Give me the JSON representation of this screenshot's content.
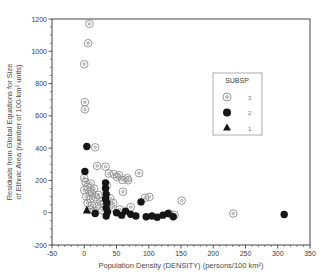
{
  "chart_data": {
    "type": "scatter",
    "title": "",
    "xlabel": "Population Density (DENSITY) (persons/100 km²)",
    "ylabel_line1": "Residuals from Global Equations for Size",
    "ylabel_line2": "of Ethnic Area (number of 100-km² units)",
    "xlim": [
      -50,
      350
    ],
    "ylim": [
      -200,
      1200
    ],
    "x_ticks": [
      -50,
      0,
      50,
      100,
      150,
      200,
      250,
      300,
      350
    ],
    "y_ticks": [
      -200,
      0,
      200,
      400,
      600,
      800,
      1000,
      1200
    ],
    "x_minor_step": 10,
    "y_minor_step": 50,
    "grid": false,
    "legend": {
      "title": "SUBSP",
      "position": "upper-right",
      "items": [
        {
          "label": "3",
          "marker": "open-double-circle"
        },
        {
          "label": "2",
          "marker": "filled-circle"
        },
        {
          "label": "1",
          "marker": "filled-triangle"
        }
      ]
    },
    "colors": {
      "open_marker": "#8c8c8c",
      "filled_marker": "#161616",
      "frame": "#444444"
    },
    "series": [
      {
        "name": "3",
        "marker": "open-double-circle",
        "points": [
          [
            8,
            1170
          ],
          [
            6,
            1050
          ],
          [
            0,
            920
          ],
          [
            1,
            685
          ],
          [
            1,
            640
          ],
          [
            17,
            405
          ],
          [
            20,
            290
          ],
          [
            33,
            285
          ],
          [
            85,
            245
          ],
          [
            38,
            243
          ],
          [
            46,
            238
          ],
          [
            54,
            232
          ],
          [
            51,
            220
          ],
          [
            67,
            214
          ],
          [
            59,
            203
          ],
          [
            68,
            201
          ],
          [
            0,
            215
          ],
          [
            2,
            190
          ],
          [
            10,
            180
          ],
          [
            35,
            170
          ],
          [
            5,
            160
          ],
          [
            15,
            150
          ],
          [
            0,
            140
          ],
          [
            8,
            130
          ],
          [
            60,
            130
          ],
          [
            12,
            120
          ],
          [
            22,
            110
          ],
          [
            3,
            100
          ],
          [
            18,
            95
          ],
          [
            40,
            90
          ],
          [
            10,
            85
          ],
          [
            25,
            70
          ],
          [
            45,
            60
          ],
          [
            5,
            60
          ],
          [
            30,
            55
          ],
          [
            12,
            45
          ],
          [
            20,
            40
          ],
          [
            42,
            30
          ],
          [
            8,
            20
          ],
          [
            28,
            15
          ],
          [
            15,
            10
          ],
          [
            55,
            20
          ],
          [
            72,
            35
          ],
          [
            94,
            92
          ],
          [
            101,
            98
          ],
          [
            151,
            75
          ],
          [
            140,
            -15
          ],
          [
            132,
            -5
          ],
          [
            231,
            -5
          ]
        ]
      },
      {
        "name": "2",
        "marker": "filled-circle",
        "points": [
          [
            4,
            410
          ],
          [
            1,
            255
          ],
          [
            33,
            185
          ],
          [
            33,
            150
          ],
          [
            34,
            115
          ],
          [
            33,
            85
          ],
          [
            35,
            60
          ],
          [
            34,
            30
          ],
          [
            36,
            5
          ],
          [
            34,
            -20
          ],
          [
            17,
            -5
          ],
          [
            50,
            0
          ],
          [
            58,
            -15
          ],
          [
            64,
            10
          ],
          [
            72,
            -10
          ],
          [
            80,
            -20
          ],
          [
            88,
            67
          ],
          [
            96,
            -25
          ],
          [
            105,
            -20
          ],
          [
            113,
            -28
          ],
          [
            122,
            -15
          ],
          [
            130,
            -5
          ],
          [
            138,
            -25
          ],
          [
            310,
            -11
          ]
        ]
      },
      {
        "name": "1",
        "marker": "filled-triangle",
        "points": [
          [
            4,
            15
          ]
        ]
      }
    ]
  }
}
